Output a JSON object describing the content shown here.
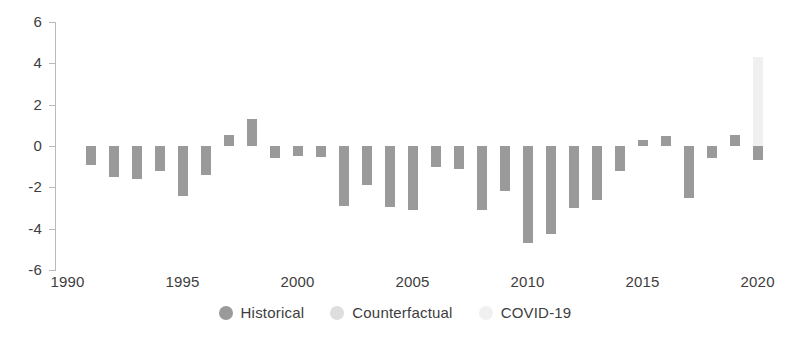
{
  "chart_data": {
    "type": "bar",
    "title": "",
    "subtitle": "",
    "xlabel": "",
    "ylabel": "",
    "ylim": [
      -6,
      6
    ],
    "xlim": [
      1989.5,
      2020.8
    ],
    "grid": false,
    "legend_position": "bottom-center",
    "y_ticks": [
      "6",
      "4",
      "2",
      "0",
      "-2",
      "-4",
      "-6"
    ],
    "y_tick_values": [
      6,
      4,
      2,
      0,
      -2,
      -4,
      -6
    ],
    "x_ticks": [
      "1990",
      "1995",
      "2000",
      "2005",
      "2010",
      "2015",
      "2020"
    ],
    "x_tick_values": [
      1990,
      1995,
      2000,
      2005,
      2010,
      2015,
      2020
    ],
    "legend": [
      {
        "name": "Historical",
        "color": "#9a9a9a"
      },
      {
        "name": "Counterfactual",
        "color": "#dedede"
      },
      {
        "name": "COVID-19",
        "color": "#f0f0f0"
      }
    ],
    "categories": [
      1991,
      1992,
      1993,
      1994,
      1995,
      1996,
      1997,
      1998,
      1999,
      2000,
      2001,
      2002,
      2003,
      2004,
      2005,
      2006,
      2007,
      2008,
      2009,
      2010,
      2011,
      2012,
      2013,
      2014,
      2015,
      2016,
      2017,
      2018,
      2019,
      2020
    ],
    "series": [
      {
        "name": "Historical",
        "color": "#9a9a9a",
        "values": [
          -0.9,
          -1.5,
          -1.6,
          -1.2,
          -2.4,
          -1.4,
          0.55,
          1.3,
          -0.6,
          -0.5,
          -0.55,
          -2.9,
          -1.9,
          -2.95,
          -3.1,
          -1.0,
          -1.1,
          -3.1,
          -2.2,
          -4.7,
          -4.25,
          -3.0,
          -2.6,
          -1.2,
          0.3,
          0.5,
          -2.5,
          -0.6,
          0.55,
          -0.7
        ]
      },
      {
        "name": "Counterfactual",
        "color": "#dedede",
        "values": [
          null,
          null,
          null,
          null,
          null,
          null,
          null,
          null,
          null,
          null,
          null,
          null,
          null,
          null,
          null,
          null,
          null,
          null,
          null,
          null,
          null,
          null,
          null,
          null,
          null,
          0.45,
          null,
          null,
          null,
          null
        ]
      },
      {
        "name": "COVID-19",
        "color": "#f0f0f0",
        "values": [
          null,
          null,
          null,
          null,
          null,
          null,
          null,
          null,
          null,
          null,
          null,
          null,
          null,
          null,
          null,
          null,
          null,
          null,
          null,
          null,
          null,
          null,
          null,
          null,
          null,
          null,
          null,
          null,
          null,
          4.3
        ]
      }
    ]
  },
  "legend": {
    "historical_label": "Historical",
    "counterfactual_label": "Counterfactual",
    "covid_label": "COVID-19"
  }
}
